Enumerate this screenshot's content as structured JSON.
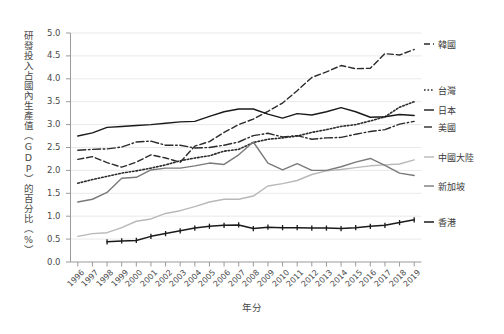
{
  "chart_data": {
    "type": "line",
    "title": "",
    "xlabel": "年分",
    "ylabel": "研發投入占國內生產值（GDP）的百分比（%）",
    "x": [
      1996,
      1997,
      1998,
      1999,
      2000,
      2001,
      2002,
      2003,
      2004,
      2005,
      2006,
      2007,
      2008,
      2009,
      2010,
      2011,
      2012,
      2013,
      2014,
      2015,
      2016,
      2017,
      2018,
      2019
    ],
    "xlim": [
      1995.5,
      2019.5
    ],
    "ylim": [
      0.0,
      5.0
    ],
    "yticks": [
      "0.0",
      "0.5",
      "1.0",
      "1.5",
      "2.0",
      "2.5",
      "3.0",
      "3.5",
      "4.0",
      "4.5",
      "5.0"
    ],
    "xticks": [
      "1996",
      "1997",
      "1998",
      "1999",
      "2000",
      "2001",
      "2002",
      "2003",
      "2004",
      "2005",
      "2006",
      "2007",
      "2008",
      "2009",
      "2010",
      "2011",
      "2012",
      "2013",
      "2014",
      "2015",
      "2016",
      "2017",
      "2018",
      "2019"
    ],
    "grid": "horizontal",
    "legend_position": "right-outside",
    "series": [
      {
        "name": "韓國",
        "style": "dashed",
        "color": "#2b2b2b",
        "marker": "none",
        "values": [
          2.24,
          2.3,
          2.17,
          2.07,
          2.18,
          2.34,
          2.27,
          2.18,
          2.53,
          2.63,
          2.83,
          3.0,
          3.12,
          3.29,
          3.47,
          3.74,
          4.03,
          4.15,
          4.29,
          4.22,
          4.23,
          4.55,
          4.52,
          4.64
        ]
      },
      {
        "name": "台灣",
        "style": "dotted",
        "color": "#2b2b2b",
        "marker": "none",
        "values": [
          1.72,
          1.8,
          1.87,
          1.94,
          1.99,
          2.05,
          2.12,
          2.21,
          2.27,
          2.32,
          2.42,
          2.46,
          2.61,
          2.68,
          2.71,
          2.75,
          2.83,
          2.89,
          2.96,
          3.0,
          3.08,
          3.17,
          3.38,
          3.5
        ]
      },
      {
        "name": "日本",
        "style": "solid",
        "color": "#1a1a1a",
        "marker": "none",
        "values": [
          2.75,
          2.82,
          2.94,
          2.96,
          2.98,
          3.0,
          3.03,
          3.06,
          3.07,
          3.18,
          3.28,
          3.34,
          3.34,
          3.23,
          3.14,
          3.24,
          3.21,
          3.28,
          3.37,
          3.28,
          3.16,
          3.17,
          3.22,
          3.2
        ]
      },
      {
        "name": "美國",
        "style": "dashdot",
        "color": "#2b2b2b",
        "marker": "none",
        "values": [
          2.44,
          2.46,
          2.47,
          2.51,
          2.62,
          2.64,
          2.55,
          2.55,
          2.49,
          2.5,
          2.55,
          2.62,
          2.76,
          2.81,
          2.73,
          2.76,
          2.68,
          2.71,
          2.72,
          2.79,
          2.85,
          2.89,
          3.01,
          3.07
        ]
      },
      {
        "name": "中國大陸",
        "style": "solid",
        "color": "#b8b8b8",
        "marker": "none",
        "values": [
          0.56,
          0.62,
          0.64,
          0.75,
          0.89,
          0.94,
          1.06,
          1.12,
          1.21,
          1.31,
          1.37,
          1.37,
          1.44,
          1.66,
          1.71,
          1.78,
          1.91,
          1.99,
          2.02,
          2.06,
          2.1,
          2.12,
          2.14,
          2.23
        ]
      },
      {
        "name": "新加坡",
        "style": "solid",
        "color": "#7a7a7a",
        "marker": "none",
        "values": [
          1.31,
          1.37,
          1.52,
          1.83,
          1.85,
          2.01,
          2.05,
          2.05,
          2.1,
          2.16,
          2.13,
          2.34,
          2.62,
          2.16,
          2.01,
          2.15,
          2.0,
          2.0,
          2.08,
          2.18,
          2.26,
          2.11,
          1.94,
          1.89
        ]
      },
      {
        "name": "香港",
        "style": "solid-marker",
        "color": "#1a1a1a",
        "marker": "tick",
        "values": [
          null,
          null,
          0.44,
          0.46,
          0.47,
          0.56,
          0.62,
          0.68,
          0.74,
          0.78,
          0.8,
          0.81,
          0.73,
          0.76,
          0.75,
          0.75,
          0.74,
          0.74,
          0.73,
          0.75,
          0.78,
          0.8,
          0.86,
          0.92
        ]
      }
    ],
    "legend": [
      {
        "label": "韓國",
        "y": 44
      },
      {
        "label": "台灣",
        "y": 90
      },
      {
        "label": "日本",
        "y": 110
      },
      {
        "label": "美國",
        "y": 127
      },
      {
        "label": "中國大陸",
        "y": 157
      },
      {
        "label": "新加坡",
        "y": 186
      },
      {
        "label": "香港",
        "y": 222
      }
    ]
  }
}
